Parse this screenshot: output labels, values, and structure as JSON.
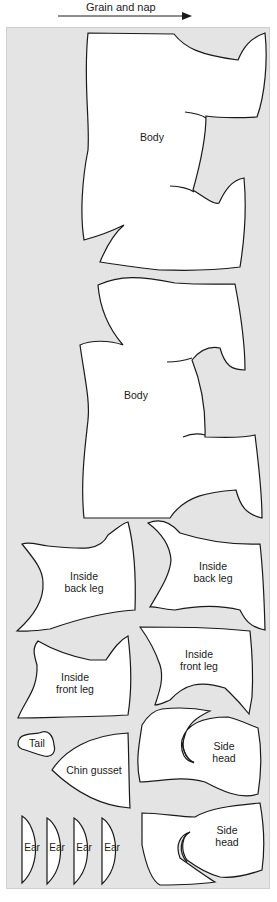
{
  "header": {
    "grain_label": "Grain and nap",
    "arrow_icon": "right-arrow-icon"
  },
  "panel": {
    "background": "#e4e4e4",
    "outline": "#1a1a1a"
  },
  "pieces": [
    {
      "id": "body-1",
      "label": "Body"
    },
    {
      "id": "body-2",
      "label": "Body"
    },
    {
      "id": "inside-back-leg-1",
      "label": "Inside back leg",
      "line1": "Inside",
      "line2": "back leg"
    },
    {
      "id": "inside-back-leg-2",
      "label": "Inside back leg",
      "line1": "Inside",
      "line2": "back leg"
    },
    {
      "id": "inside-front-leg-1",
      "label": "Inside front leg",
      "line1": "Inside",
      "line2": "front leg"
    },
    {
      "id": "inside-front-leg-2",
      "label": "Inside front leg",
      "line1": "Inside",
      "line2": "front leg"
    },
    {
      "id": "tail",
      "label": "Tail"
    },
    {
      "id": "chin-gusset",
      "label": "Chin gusset"
    },
    {
      "id": "side-head-1",
      "label": "Side head",
      "line1": "Side",
      "line2": "head"
    },
    {
      "id": "side-head-2",
      "label": "Side head",
      "line1": "Side",
      "line2": "head"
    },
    {
      "id": "ear-1",
      "label": "Ear"
    },
    {
      "id": "ear-2",
      "label": "Ear"
    },
    {
      "id": "ear-3",
      "label": "Ear"
    },
    {
      "id": "ear-4",
      "label": "Ear"
    }
  ]
}
